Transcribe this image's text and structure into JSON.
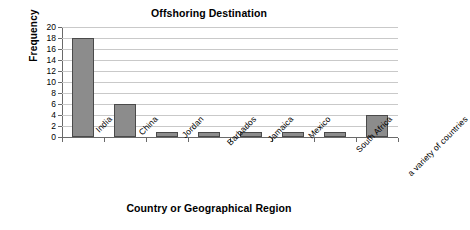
{
  "chart_data": {
    "type": "bar",
    "title": "Offshoring Destination",
    "xlabel": "Country or Geographical Region",
    "ylabel": "Frequency",
    "categories": [
      "India",
      "China",
      "Jordan",
      "Barbados",
      "Jamaica",
      "Mexico",
      "South Africa",
      "a variety of countries"
    ],
    "values": [
      18,
      6,
      1,
      1,
      1,
      1,
      1,
      4
    ],
    "ylim": [
      0,
      20
    ],
    "ytick_labels": [
      "0",
      "2",
      "4",
      "6",
      "8",
      "10",
      "12",
      "14",
      "16",
      "18",
      "20"
    ],
    "ytick_values": [
      0,
      2,
      4,
      6,
      8,
      10,
      12,
      14,
      16,
      18,
      20
    ],
    "grid": "horizontal",
    "legend": "none",
    "bar_color": "#8c8c8c",
    "bar_edge_color": "#4a4a4a",
    "gridline_color": "#c9c9c9",
    "axis_color": "#6a6a6a",
    "background_color": "#ffffff",
    "xtick_label_rotation": -45
  }
}
